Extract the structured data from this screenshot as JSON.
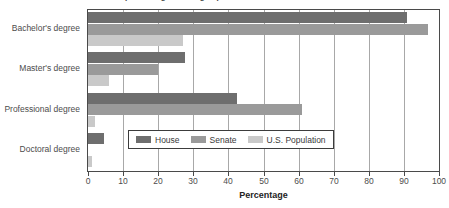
{
  "title_remnant": "Educational Attainment (Percentage with degree)",
  "chart_data": {
    "type": "bar",
    "orientation": "horizontal",
    "title": "",
    "xlabel": "Percentage",
    "ylabel": "",
    "xlim": [
      0,
      100
    ],
    "xticks": [
      0,
      10,
      20,
      30,
      40,
      50,
      60,
      70,
      80,
      90,
      100
    ],
    "xtick_labels": [
      "0",
      "10",
      "20",
      "30",
      "40",
      "50",
      "60",
      "70",
      "80",
      "90",
      "100"
    ],
    "grid": true,
    "grid_axis": "x",
    "legend_position": "inside-lower-center",
    "categories": [
      "Bachelor's degree",
      "Master's degree",
      "Professional degree",
      "Doctoral degree"
    ],
    "series": [
      {
        "name": "House",
        "color": "#6e6e6e",
        "values": [
          91,
          27.5,
          42.5,
          4.5
        ]
      },
      {
        "name": "Senate",
        "color": "#9a9a9a",
        "values": [
          97,
          20,
          61,
          0
        ]
      },
      {
        "name": "U.S. Population",
        "color": "#c9c9c9",
        "values": [
          27,
          6,
          2,
          1
        ]
      }
    ]
  },
  "legend": {
    "entries": [
      {
        "label": "House",
        "swatch": "house"
      },
      {
        "label": "Senate",
        "swatch": "senate"
      },
      {
        "label": "U.S. Population",
        "swatch": "pop"
      }
    ]
  },
  "colors": {
    "house": "#6e6e6e",
    "senate": "#9a9a9a",
    "population": "#c9c9c9",
    "axis": "#4a4a4a",
    "grid": "#a8a8a8",
    "text": "#4c4c4c",
    "background": "#ffffff"
  }
}
